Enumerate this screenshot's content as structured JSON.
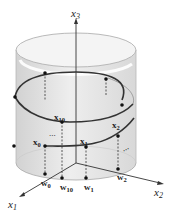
{
  "diagram": {
    "type": "3d-cylinder-helix",
    "axes": {
      "x1": {
        "label": "x",
        "sub": "1"
      },
      "x2": {
        "label": "x",
        "sub": "2"
      },
      "x3": {
        "label": "x",
        "sub": "3"
      }
    },
    "points": {
      "x0": {
        "label": "x",
        "sub": "0"
      },
      "x1": {
        "label": "x",
        "sub": "1"
      },
      "x2": {
        "label": "x",
        "sub": "2"
      },
      "x10": {
        "label": "x",
        "sub": "10"
      },
      "w0": {
        "label": "w",
        "sub": "0"
      },
      "w1": {
        "label": "w",
        "sub": "1"
      },
      "w2": {
        "label": "w",
        "sub": "2"
      },
      "w10": {
        "label": "w",
        "sub": "10"
      }
    },
    "ellipsis": "...",
    "colors": {
      "cylinder_fill": "#e6e6e6",
      "cylinder_edge": "#b0b0b0",
      "helix": "#333333",
      "axis": "#333333"
    }
  }
}
